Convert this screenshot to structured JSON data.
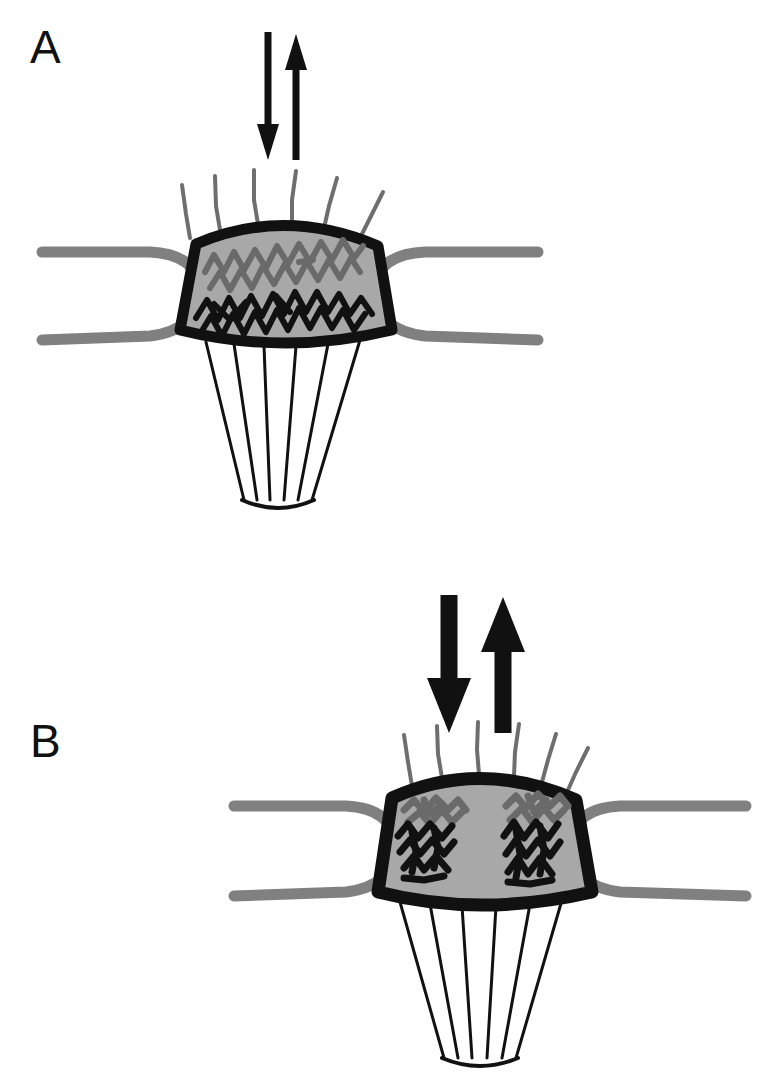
{
  "figure": {
    "type": "diagram",
    "background_color": "#ffffff",
    "width": 776,
    "height": 1092
  },
  "palette": {
    "outline_black": "#111111",
    "cytoplasm_gray": "#a8a8a8",
    "process_gray": "#808080",
    "cilia_gray": "#6e6e6e",
    "squiggle_dark_gray": "#6a6a6a",
    "squiggle_black": "#111111",
    "paper_white": "#ffffff"
  },
  "panels": [
    {
      "id": "A",
      "label": "A",
      "label_x": 30,
      "label_y": 24,
      "center_x": 285,
      "center_y": 290,
      "state": "dispersed",
      "arrows": {
        "style": "thin",
        "shaft_width": 7,
        "head_width": 22,
        "down_arrow_x": 268,
        "up_arrow_x": 296,
        "top_y": 32,
        "bottom_y": 160,
        "color": "#111111",
        "meaning": "bidirectional transport, low flux"
      },
      "cilia": {
        "count": 6,
        "color": "#6e6e6e",
        "width": 4
      },
      "membrane": {
        "outline_width": 11,
        "fill": "#a8a8a8",
        "color": "#111111"
      },
      "squiggles": {
        "arrangement": "spread across full cell width",
        "upper_color": "#6a6a6a",
        "lower_color": "#111111",
        "upper_count": 2,
        "lower_count": 2
      },
      "lateral_processes": {
        "color": "#808080",
        "width": 11,
        "left_end_x": 40,
        "right_end_x": 540
      },
      "root_filaments": {
        "count": 6,
        "color": "#111111",
        "width": 3,
        "converge_y": 500
      }
    },
    {
      "id": "B",
      "label": "B",
      "label_x": 30,
      "label_y": 718,
      "center_x": 480,
      "center_y": 845,
      "state": "condensed",
      "arrows": {
        "style": "thick",
        "shaft_width": 17,
        "head_width": 44,
        "down_arrow_x": 449,
        "up_arrow_x": 503,
        "top_y": 595,
        "bottom_y": 733,
        "color": "#111111",
        "meaning": "bidirectional transport, high flux"
      },
      "cilia": {
        "count": 6,
        "color": "#6e6e6e",
        "width": 4
      },
      "membrane": {
        "outline_width": 13,
        "fill": "#a8a8a8",
        "color": "#111111"
      },
      "squiggles": {
        "arrangement": "condensed into two compact clusters at left and right edges",
        "upper_color": "#6a6a6a",
        "lower_color": "#111111",
        "cluster_count": 2
      },
      "lateral_processes": {
        "color": "#808080",
        "width": 11,
        "left_end_x": 232,
        "right_end_x": 748
      },
      "root_filaments": {
        "count": 6,
        "color": "#111111",
        "width": 3,
        "converge_y": 1058
      }
    }
  ]
}
